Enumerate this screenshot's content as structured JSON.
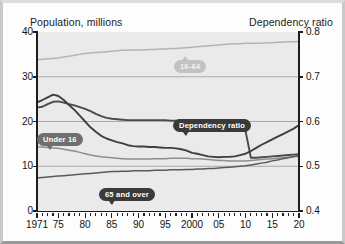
{
  "chart_data": {
    "type": "line",
    "title": "",
    "xlabel": "",
    "ylabel": "Population, millions",
    "y2label": "Dependency ratio",
    "grid": true,
    "legend": "inline-callouts",
    "xlim": [
      1971,
      2020
    ],
    "ylim": [
      0,
      40
    ],
    "y2lim": [
      0.4,
      0.8
    ],
    "yticks": [
      0,
      10,
      20,
      30,
      40
    ],
    "y2ticks": [
      0.4,
      0.5,
      0.6,
      0.7,
      0.8
    ],
    "xticks": [
      1971,
      1975,
      1980,
      1985,
      1990,
      1995,
      2000,
      2005,
      2010,
      2015,
      2020
    ],
    "xticklabels": [
      "1971",
      "75",
      "80",
      "85",
      "90",
      "95",
      "2000",
      "05",
      "10",
      "15",
      "20"
    ],
    "x": [
      1971,
      1972,
      1973,
      1974,
      1975,
      1976,
      1977,
      1978,
      1979,
      1980,
      1981,
      1982,
      1983,
      1984,
      1985,
      1986,
      1987,
      1988,
      1989,
      1990,
      1991,
      1992,
      1993,
      1994,
      1995,
      1996,
      1997,
      1998,
      1999,
      2000,
      2001,
      2002,
      2003,
      2004,
      2005,
      2006,
      2007,
      2008,
      2009,
      2010,
      2011,
      2012,
      2013,
      2014,
      2015,
      2016,
      2017,
      2018,
      2019,
      2020
    ],
    "series": [
      {
        "name": "16-64",
        "label": "16-64",
        "axis": "left",
        "color": "#b4b4b4",
        "values": [
          33.8,
          33.9,
          34.0,
          34.1,
          34.2,
          34.4,
          34.6,
          34.8,
          35.0,
          35.2,
          35.3,
          35.4,
          35.5,
          35.6,
          35.7,
          35.8,
          35.9,
          35.9,
          36.0,
          36.0,
          36.0,
          36.1,
          36.1,
          36.2,
          36.2,
          36.3,
          36.3,
          36.4,
          36.5,
          36.6,
          36.7,
          36.8,
          36.9,
          37.0,
          37.1,
          37.2,
          37.3,
          37.4,
          37.4,
          37.5,
          37.5,
          37.5,
          37.5,
          37.6,
          37.6,
          37.7,
          37.7,
          37.8,
          37.8,
          37.9
        ]
      },
      {
        "name": "Under 16",
        "label": "Under 16",
        "axis": "left",
        "color": "#4a4a4a",
        "values": [
          23.1,
          23.3,
          23.9,
          24.4,
          24.5,
          24.2,
          23.9,
          23.6,
          23.2,
          22.8,
          22.3,
          21.7,
          21.2,
          20.8,
          20.6,
          20.5,
          20.4,
          20.3,
          20.3,
          20.3,
          20.3,
          20.3,
          20.3,
          20.3,
          20.3,
          20.2,
          20.2,
          20.1,
          20.0,
          19.9,
          19.7,
          19.4,
          19.1,
          18.9,
          18.7,
          18.5,
          18.4,
          18.2,
          18.0,
          17.9,
          11.9,
          11.9,
          12.0,
          12.1,
          12.2,
          12.3,
          12.4,
          12.5,
          12.6,
          12.7
        ]
      },
      {
        "name": "Under 16 (millions)",
        "label": "Under 16",
        "axis": "left",
        "color": "#8d8d8d",
        "values": [
          14.3,
          14.3,
          14.2,
          14.1,
          14.0,
          13.8,
          13.6,
          13.4,
          13.1,
          12.8,
          12.5,
          12.3,
          12.1,
          12.0,
          11.9,
          11.8,
          11.7,
          11.6,
          11.6,
          11.6,
          11.6,
          11.6,
          11.7,
          11.7,
          11.7,
          11.8,
          11.8,
          11.8,
          11.8,
          11.7,
          11.7,
          11.6,
          11.5,
          11.4,
          11.3,
          11.3,
          11.2,
          11.2,
          11.2,
          11.2,
          11.3,
          11.4,
          11.5,
          11.6,
          11.7,
          11.8,
          11.9,
          12.0,
          12.1,
          12.2
        ]
      },
      {
        "name": "65 and over",
        "label": "65 and over",
        "axis": "left",
        "color": "#5a5a5a",
        "values": [
          7.4,
          7.5,
          7.6,
          7.7,
          7.8,
          7.9,
          8.0,
          8.1,
          8.2,
          8.3,
          8.4,
          8.5,
          8.6,
          8.7,
          8.8,
          8.8,
          8.9,
          8.9,
          9.0,
          9.0,
          9.0,
          9.0,
          9.1,
          9.1,
          9.1,
          9.2,
          9.2,
          9.2,
          9.3,
          9.3,
          9.4,
          9.4,
          9.5,
          9.5,
          9.6,
          9.7,
          9.8,
          9.9,
          10.0,
          10.1,
          10.3,
          10.5,
          10.7,
          10.9,
          11.2,
          11.4,
          11.7,
          11.9,
          12.2,
          12.5
        ]
      },
      {
        "name": "Dependency ratio",
        "label": "Dependency ratio",
        "axis": "right",
        "color": "#3f3f3f",
        "values": [
          0.643,
          0.648,
          0.654,
          0.66,
          0.657,
          0.648,
          0.637,
          0.626,
          0.613,
          0.6,
          0.587,
          0.577,
          0.568,
          0.562,
          0.558,
          0.554,
          0.551,
          0.547,
          0.545,
          0.544,
          0.544,
          0.543,
          0.543,
          0.542,
          0.541,
          0.541,
          0.54,
          0.538,
          0.535,
          0.53,
          0.528,
          0.525,
          0.522,
          0.521,
          0.52,
          0.521,
          0.521,
          0.522,
          0.525,
          0.528,
          0.534,
          0.541,
          0.548,
          0.554,
          0.56,
          0.566,
          0.572,
          0.578,
          0.584,
          0.592
        ]
      }
    ]
  }
}
